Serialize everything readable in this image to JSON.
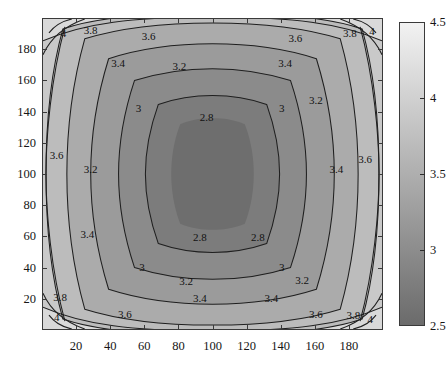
{
  "figure": {
    "title": "",
    "background": "#ffffff"
  },
  "chart_data": {
    "type": "heatmap",
    "subtype": "filled-contour",
    "title": "",
    "xlabel": "",
    "ylabel": "",
    "xlim": [
      0,
      200
    ],
    "ylim": [
      0,
      200
    ],
    "xticks": [
      20,
      40,
      60,
      80,
      100,
      120,
      140,
      160,
      180
    ],
    "yticks": [
      20,
      40,
      60,
      80,
      100,
      120,
      140,
      160,
      180
    ],
    "xticklabels": [
      "20",
      "40",
      "60",
      "80",
      "100",
      "120",
      "140",
      "160",
      "180"
    ],
    "yticklabels": [
      "20",
      "40",
      "60",
      "80",
      "100",
      "120",
      "140",
      "160",
      "180"
    ],
    "grid": false,
    "legend": "none",
    "colormap": "gray",
    "colorbar": {
      "orientation": "vertical",
      "position": "right",
      "vmin": 2.5,
      "vmax": 4.5,
      "ticks": [
        2.5,
        3,
        3.5,
        4,
        4.5
      ],
      "ticklabels": [
        "2.5",
        "3",
        "3.5",
        "4",
        "4.5"
      ],
      "low_color": "#6b6b6b",
      "high_color": "#f2f2f2"
    },
    "contour_levels": [
      2.8,
      3,
      3.2,
      3.4,
      3.6,
      3.8,
      4
    ],
    "contour_labels": [
      "2.8",
      "3",
      "3.2",
      "3.4",
      "3.6",
      "3.8",
      "4"
    ],
    "contour_line_color": "#1f1f1f",
    "min_value": 2.5,
    "max_value": 4.5,
    "center": [
      100,
      100
    ],
    "band_colors": [
      {
        "range": "2.5-2.8",
        "color": "#6e6e6e"
      },
      {
        "range": "2.8-3.0",
        "color": "#7a7a7a"
      },
      {
        "range": "3.0-3.2",
        "color": "#888888"
      },
      {
        "range": "3.2-3.4",
        "color": "#999999"
      },
      {
        "range": "3.4-3.6",
        "color": "#aaaaaa"
      },
      {
        "range": "3.6-3.8",
        "color": "#b9b9b9"
      },
      {
        "range": "3.8-4.0",
        "color": "#c8c8c8"
      },
      {
        "range": "4.0-4.5",
        "color": "#d8d8d8"
      }
    ],
    "inline_labels": [
      {
        "text": "4",
        "x": 12,
        "y": 191
      },
      {
        "text": "3.8",
        "x": 28,
        "y": 193
      },
      {
        "text": "3.6",
        "x": 62,
        "y": 189
      },
      {
        "text": "3.6",
        "x": 148,
        "y": 188
      },
      {
        "text": "3.8",
        "x": 180,
        "y": 191
      },
      {
        "text": "4",
        "x": 193,
        "y": 192
      },
      {
        "text": "3.4",
        "x": 44,
        "y": 172
      },
      {
        "text": "3.2",
        "x": 80,
        "y": 170
      },
      {
        "text": "3.4",
        "x": 142,
        "y": 172
      },
      {
        "text": "3",
        "x": 56,
        "y": 143
      },
      {
        "text": "2.8",
        "x": 96,
        "y": 137
      },
      {
        "text": "3",
        "x": 140,
        "y": 143
      },
      {
        "text": "3.2",
        "x": 160,
        "y": 148
      },
      {
        "text": "3.6",
        "x": 8,
        "y": 113
      },
      {
        "text": "3.2",
        "x": 28,
        "y": 104
      },
      {
        "text": "3.4",
        "x": 172,
        "y": 104
      },
      {
        "text": "3.6",
        "x": 189,
        "y": 110
      },
      {
        "text": "3.4",
        "x": 26,
        "y": 62
      },
      {
        "text": "2.8",
        "x": 92,
        "y": 60
      },
      {
        "text": "2.8",
        "x": 126,
        "y": 60
      },
      {
        "text": "3",
        "x": 58,
        "y": 41
      },
      {
        "text": "3",
        "x": 140,
        "y": 41
      },
      {
        "text": "3.2",
        "x": 84,
        "y": 32
      },
      {
        "text": "3.2",
        "x": 152,
        "y": 33
      },
      {
        "text": "3.8",
        "x": 10,
        "y": 22
      },
      {
        "text": "3.4",
        "x": 92,
        "y": 21
      },
      {
        "text": "3.4",
        "x": 134,
        "y": 21
      },
      {
        "text": "4",
        "x": 8,
        "y": 9
      },
      {
        "text": "3.6",
        "x": 48,
        "y": 11
      },
      {
        "text": "3.6",
        "x": 160,
        "y": 11
      },
      {
        "text": "3.8",
        "x": 182,
        "y": 10
      },
      {
        "text": "4",
        "x": 192,
        "y": 8
      }
    ]
  }
}
